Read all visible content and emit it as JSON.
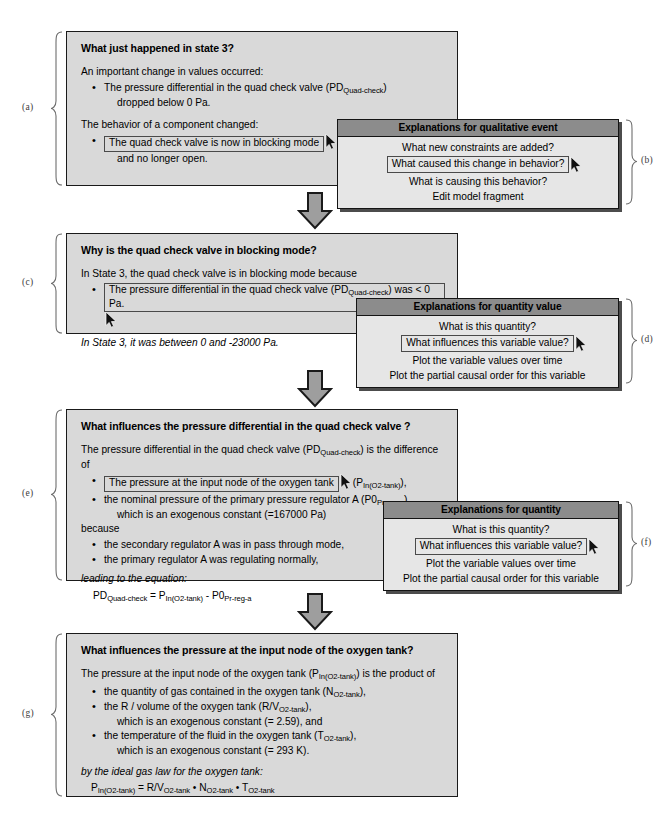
{
  "figure": {
    "panels": [
      {
        "id": "a",
        "label": "(a)",
        "question": "What just happened in state 3?",
        "line1": "An important change in values occurred:",
        "bullet1_pre": "The pressure differential in the quad check valve (PD",
        "bullet1_sub": "Quad-check",
        "bullet1_post": ")",
        "bullet1_line2": "dropped below 0 Pa.",
        "line2": "The behavior of a component changed:",
        "selected_text": "The quad check valve is now in blocking mode",
        "bullet2_line2": "and no longer open."
      },
      {
        "id": "c",
        "label": "(c)",
        "question": "Why is the quad check valve in blocking mode?",
        "line1": "In State 3, the quad check valve is in blocking mode because",
        "selected_pre": "The pressure differential in the quad check valve (PD",
        "selected_sub": "Quad-check",
        "selected_post": ") was < 0 Pa.",
        "footnote": "In State 3, it was between 0 and -23000 Pa."
      },
      {
        "id": "e",
        "label": "(e)",
        "question": "What influences the pressure differential in the quad check valve ?",
        "line1_pre": "The pressure differential in the quad check valve (PD",
        "line1_sub": "Quad-check",
        "line1_post": ") is the difference of",
        "selected_text": "The pressure at the input node of the oxygen tank",
        "after_selected_pre": "(P",
        "after_selected_sub": "In(O2-tank)",
        "after_selected_post": "),",
        "bullet2_pre": "the nominal pressure of the primary pressure regulator A (P0",
        "bullet2_sub": "Pr-reg-a",
        "bullet2_post": "),",
        "bullet2_line2": "which is an exogenous constant (=167000 Pa)",
        "because": "because",
        "bullet3": "the secondary regulator A was in pass through mode,",
        "bullet4": "the primary regulator A was regulating normally,",
        "eq_intro": "leading to the equation:",
        "eq_lhs_pre": "PD",
        "eq_lhs_sub": "Quad-check",
        "eq_mid": "  =  P",
        "eq_rhs1_sub": "In(O2-tank)",
        "eq_rhs_op": "  -  P0",
        "eq_rhs2_sub": "Pr-reg-a"
      },
      {
        "id": "g",
        "label": "(g)",
        "question": "What influences the pressure at the input node of the oxygen tank?",
        "line1_pre": "The pressure at the input node of the oxygen tank (P",
        "line1_sub": "In(O2-tank)",
        "line1_post": ") is the product of",
        "bullet1_pre": "the quantity of gas contained in the oxygen tank (N",
        "bullet1_sub": "O2-tank",
        "bullet1_post": "),",
        "bullet2_pre": "the R / volume of the oxygen tank (R/V",
        "bullet2_sub": "O2-tank",
        "bullet2_post": "),",
        "bullet2_line2": "which is an exogenous constant (= 2.59), and",
        "bullet3_pre": "the temperature of the fluid in the oxygen tank (T",
        "bullet3_sub": "O2-tank",
        "bullet3_post": "),",
        "bullet3_line2": "which is an exogenous constant (= 293 K).",
        "eq_intro": "by the ideal gas law for the oxygen tank:",
        "eq_lhs_pre": "P",
        "eq_lhs_sub": "In(O2-tank)",
        "eq_eq": "  =  R/V",
        "eq_t1_sub": "O2-tank",
        "eq_dot1": " • N",
        "eq_t2_sub": "O2-tank",
        "eq_dot2": " • T",
        "eq_t3_sub": "O2-tank"
      }
    ],
    "menus": [
      {
        "id": "b",
        "label": "(b)",
        "title": "Explanations for qualitative event",
        "items": [
          {
            "text": "What new constraints are added?",
            "selected": false
          },
          {
            "text": "What caused this change in behavior?",
            "selected": true
          },
          {
            "text": "What is causing this behavior?",
            "selected": false
          },
          {
            "text": "Edit model fragment",
            "selected": false
          }
        ]
      },
      {
        "id": "d",
        "label": "(d)",
        "title": "Explanations for quantity value",
        "items": [
          {
            "text": "What is this quantity?",
            "selected": false
          },
          {
            "text": "What influences this variable value?",
            "selected": true
          },
          {
            "text": "Plot the variable values over time",
            "selected": false
          },
          {
            "text": "Plot the partial causal order for this variable",
            "selected": false
          }
        ]
      },
      {
        "id": "f",
        "label": "(f)",
        "title": "Explanations for quantity",
        "items": [
          {
            "text": "What is this quantity?",
            "selected": false
          },
          {
            "text": "What influences this variable value?",
            "selected": true
          },
          {
            "text": "Plot the variable values over time",
            "selected": false
          },
          {
            "text": "Plot the partial causal order for this variable",
            "selected": false
          }
        ]
      }
    ],
    "colors": {
      "panel_bg": "#d9d9d9",
      "menu_bg": "#e6e6e6",
      "menu_header_bg": "#8c8c8c",
      "arrow_fill": "#9e9e9e",
      "outline": "#1a1a1a"
    },
    "icons": {
      "cursor": "mouse-pointer-icon",
      "flow_arrow": "down-block-arrow-icon"
    }
  }
}
